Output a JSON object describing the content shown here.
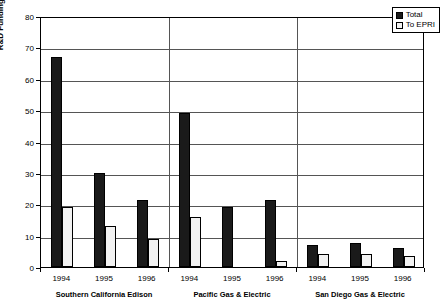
{
  "chart_data": {
    "type": "bar",
    "title": "",
    "xlabel": "",
    "ylabel": "R&D Funding (Million 1996$)",
    "ylim": [
      0,
      80
    ],
    "ytick_step": 10,
    "yticks": [
      0,
      10,
      20,
      30,
      40,
      50,
      60,
      70,
      80
    ],
    "grid": true,
    "legend_position": "top-right",
    "categories": [
      "1994",
      "1995",
      "1996",
      "1994",
      "1995",
      "1996",
      "1994",
      "1995",
      "1996"
    ],
    "groups": [
      {
        "name": "Southern California Edison",
        "years": [
          "1994",
          "1995",
          "1996"
        ],
        "total": [
          67,
          30,
          21.5
        ],
        "to_epri": [
          19,
          13,
          9
        ]
      },
      {
        "name": "Pacific Gas & Electric",
        "years": [
          "1994",
          "1995",
          "1996"
        ],
        "total": [
          49,
          19,
          21.5
        ],
        "to_epri": [
          16,
          0,
          2
        ]
      },
      {
        "name": "San Diego Gas & Electric",
        "years": [
          "1994",
          "1995",
          "1996"
        ],
        "total": [
          7,
          7.5,
          6
        ],
        "to_epri": [
          4,
          4,
          3.5
        ]
      }
    ],
    "series": [
      {
        "name": "Total",
        "color": "#1a1a1a",
        "values": [
          67,
          30,
          21.5,
          49,
          19,
          21.5,
          7,
          7.5,
          6
        ]
      },
      {
        "name": "To EPRI",
        "color": "#f2f2f2",
        "values": [
          19,
          13,
          9,
          16,
          0,
          2,
          4,
          4,
          3.5
        ]
      }
    ]
  },
  "legend": {
    "items": [
      {
        "label": "Total",
        "swatch": "total"
      },
      {
        "label": "To EPRI",
        "swatch": "epri"
      }
    ]
  }
}
